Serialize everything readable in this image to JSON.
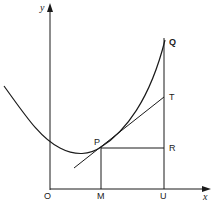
{
  "diagram": {
    "axes": {
      "x_label": "x",
      "y_label": "y",
      "origin_label": "O"
    },
    "points": {
      "P": "P",
      "Q": "Q",
      "R": "R",
      "T": "T",
      "M": "M",
      "U": "U"
    },
    "colors": {
      "line": "#1a1a1a",
      "background": "#ffffff"
    }
  }
}
